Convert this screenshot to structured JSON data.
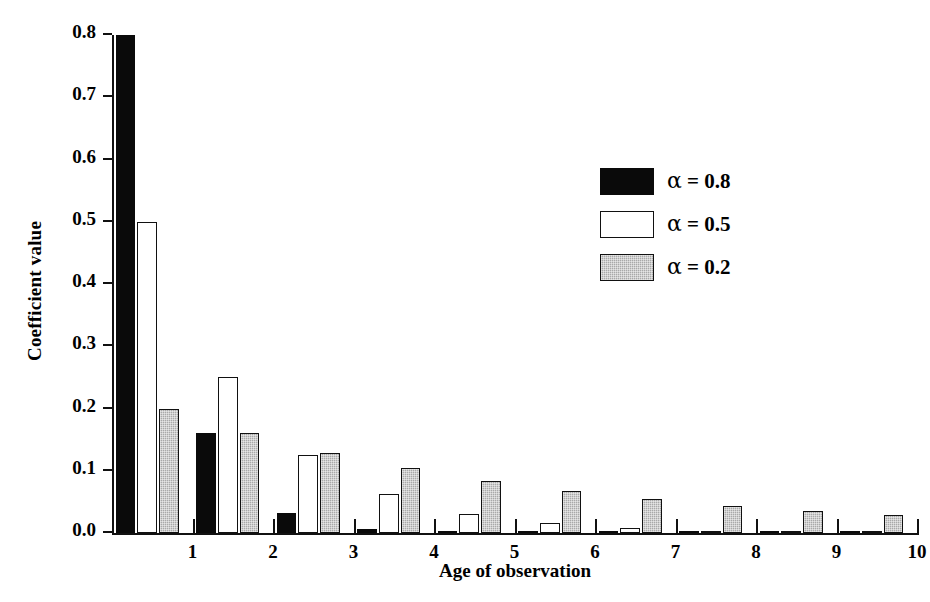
{
  "chart_data": {
    "type": "bar",
    "title": "",
    "xlabel": "Age of observation",
    "ylabel": "Coefficient value",
    "categories": [
      "1",
      "2",
      "3",
      "4",
      "5",
      "6",
      "7",
      "8",
      "9",
      "10"
    ],
    "series": [
      {
        "name": "alpha = 0.8",
        "legend_label": "α = 0.8",
        "alpha": "0.8",
        "color": "#0a0a0a",
        "fill": "black",
        "values": [
          0.8,
          0.16,
          0.032,
          0.006,
          0.001,
          0.0,
          0.0,
          0.0,
          0.0,
          0.0
        ]
      },
      {
        "name": "alpha = 0.5",
        "legend_label": "α = 0.5",
        "alpha": "0.5",
        "color": "#ffffff",
        "fill": "white",
        "values": [
          0.5,
          0.25,
          0.125,
          0.063,
          0.031,
          0.016,
          0.008,
          0.004,
          0.002,
          0.001
        ]
      },
      {
        "name": "alpha = 0.2",
        "legend_label": "α = 0.2",
        "alpha": "0.2",
        "color": "#a9a9a9",
        "fill": "gray",
        "values": [
          0.2,
          0.16,
          0.128,
          0.105,
          0.084,
          0.067,
          0.054,
          0.044,
          0.036,
          0.029
        ]
      }
    ],
    "series_draw_order": [
      "alpha = 0.8",
      "alpha = 0.5",
      "alpha = 0.2"
    ],
    "ylim": [
      0.0,
      0.8
    ],
    "yticks": [
      "0.0",
      "0.1",
      "0.2",
      "0.3",
      "0.4",
      "0.5",
      "0.6",
      "0.7",
      "0.8"
    ],
    "ytick_values": [
      0.0,
      0.1,
      0.2,
      0.3,
      0.4,
      0.5,
      0.6,
      0.7,
      0.8
    ],
    "grid": false,
    "legend_position": "upper right",
    "xtick_labels_between_groups": true
  },
  "axes": {
    "y_title": "Coefficient value",
    "x_title": "Age of observation"
  }
}
